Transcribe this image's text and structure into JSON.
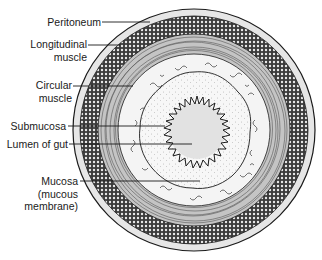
{
  "diagram": {
    "labels": [
      {
        "id": "peritoneum",
        "lines": [
          "Peritoneum"
        ]
      },
      {
        "id": "longitudinal-muscle",
        "lines": [
          "Longitudinal",
          "muscle"
        ]
      },
      {
        "id": "circular-muscle",
        "lines": [
          "Circular",
          "muscle"
        ]
      },
      {
        "id": "submucosa",
        "lines": [
          "Submucosa"
        ]
      },
      {
        "id": "lumen",
        "lines": [
          "Lumen of gut"
        ]
      },
      {
        "id": "mucosa",
        "lines": [
          "Mucosa",
          "(mucous",
          "membrane)"
        ]
      }
    ],
    "colors": {
      "line": "#1a1a1a",
      "serosa": "#e6e6e6",
      "longitudinal": "#4a4a4a",
      "circular": "#bdbdbd",
      "submucosa": "#f4f4f4",
      "mucosa": "#fafafa",
      "lumen": "#e2e2e2"
    }
  }
}
